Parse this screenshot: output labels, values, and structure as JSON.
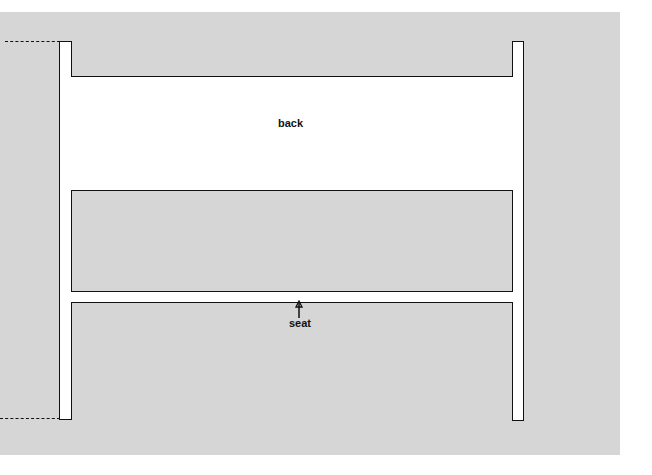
{
  "diagram": {
    "labels": {
      "back": "back",
      "seat": "seat"
    },
    "colors": {
      "background_panel": "#d6d6d6",
      "shapes_fill": "#ffffff",
      "stroke": "#111111"
    }
  }
}
